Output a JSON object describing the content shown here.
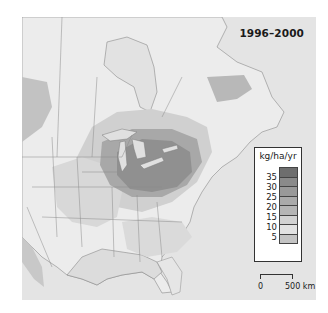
{
  "map": {
    "title": "1996–2000",
    "background_color": "#e6e6e6",
    "ocean_color": "#e0e0e0",
    "land_color": "#ececec",
    "border_color": "#7a7a7a"
  },
  "legend": {
    "unit": "kg/ha/yr",
    "classes": [
      {
        "color": "#6e6e6e",
        "label": ""
      },
      {
        "color": "#8a8a8a",
        "label": "35"
      },
      {
        "color": "#999999",
        "label": "30"
      },
      {
        "color": "#aaaaaa",
        "label": "25"
      },
      {
        "color": "#b5b5b5",
        "label": "20"
      },
      {
        "color": "#d2d2d2",
        "label": "15"
      },
      {
        "color": "#e2e2e2",
        "label": "10"
      },
      {
        "color": "#c4c4c4",
        "label": "5"
      }
    ],
    "tick_labels": [
      "35",
      "30",
      "25",
      "20",
      "15",
      "10",
      "5"
    ]
  },
  "scale_bar": {
    "start_label": "0",
    "end_label": "500 km"
  }
}
